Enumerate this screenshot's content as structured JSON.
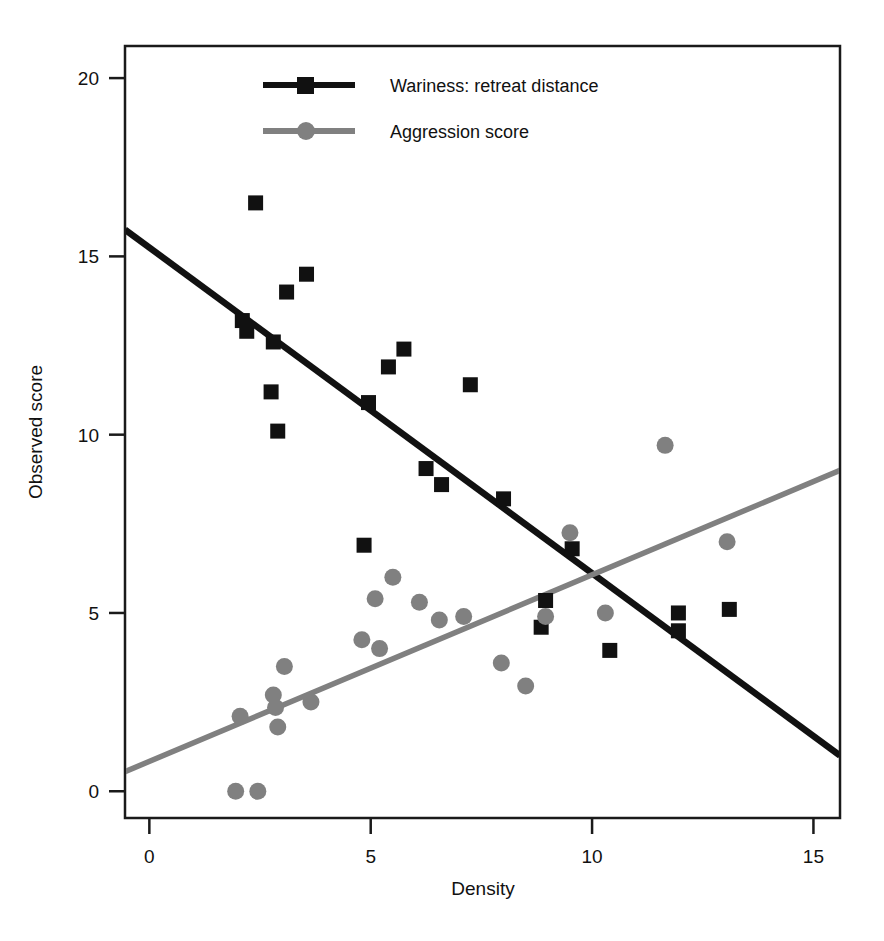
{
  "chart_data": {
    "type": "scatter",
    "title": "",
    "xlabel": "Density",
    "ylabel": "Observed  score",
    "xlim": [
      -0.55,
      15.6
    ],
    "ylim": [
      -0.75,
      20.9
    ],
    "xticks": [
      0,
      5,
      10,
      15
    ],
    "yticks": [
      0,
      5,
      10,
      15,
      20
    ],
    "xtick_labels": [
      "0",
      "5",
      "10",
      "15"
    ],
    "ytick_labels": [
      "0",
      "5",
      "10",
      "15",
      "20"
    ],
    "grid": false,
    "frame": true,
    "legend_position": "top-center",
    "series": [
      {
        "name": "Wariness: retreat distance",
        "marker": "square",
        "color": "#111111",
        "points": [
          [
            2.1,
            13.2
          ],
          [
            2.2,
            12.9
          ],
          [
            2.4,
            16.5
          ],
          [
            2.75,
            11.2
          ],
          [
            2.8,
            12.6
          ],
          [
            2.9,
            10.1
          ],
          [
            3.1,
            14.0
          ],
          [
            3.55,
            14.5
          ],
          [
            4.85,
            6.9
          ],
          [
            4.95,
            10.9
          ],
          [
            5.4,
            11.9
          ],
          [
            5.75,
            12.4
          ],
          [
            6.25,
            9.05
          ],
          [
            6.6,
            8.6
          ],
          [
            7.25,
            11.4
          ],
          [
            8.0,
            8.2
          ],
          [
            8.85,
            4.6
          ],
          [
            8.95,
            5.35
          ],
          [
            9.55,
            6.8
          ],
          [
            10.4,
            3.95
          ],
          [
            11.95,
            4.5
          ],
          [
            11.95,
            5.0
          ],
          [
            13.1,
            5.1
          ]
        ],
        "fit_line": {
          "x": [
            -0.55,
            15.6
          ],
          "y": [
            15.75,
            1.0
          ]
        }
      },
      {
        "name": "Aggression score",
        "marker": "circle",
        "color": "#808080",
        "points": [
          [
            1.95,
            0.0
          ],
          [
            2.45,
            0.0
          ],
          [
            2.05,
            2.1
          ],
          [
            2.8,
            2.7
          ],
          [
            2.85,
            2.35
          ],
          [
            2.9,
            1.8
          ],
          [
            3.05,
            3.5
          ],
          [
            3.65,
            2.5
          ],
          [
            4.8,
            4.25
          ],
          [
            5.1,
            5.4
          ],
          [
            5.2,
            4.0
          ],
          [
            5.5,
            6.0
          ],
          [
            6.1,
            5.3
          ],
          [
            6.55,
            4.8
          ],
          [
            7.1,
            4.9
          ],
          [
            7.95,
            3.6
          ],
          [
            8.5,
            2.95
          ],
          [
            8.95,
            4.9
          ],
          [
            9.5,
            7.25
          ],
          [
            10.3,
            5.0
          ],
          [
            11.65,
            9.7
          ],
          [
            13.05,
            7.0
          ]
        ],
        "fit_line": {
          "x": [
            -0.55,
            15.6
          ],
          "y": [
            0.55,
            9.0
          ]
        }
      }
    ]
  },
  "legend": {
    "entries": [
      {
        "label": "Wariness: retreat distance",
        "marker": "square",
        "color": "#111111"
      },
      {
        "label": "Aggression score",
        "marker": "circle",
        "color": "#808080"
      }
    ]
  },
  "axes": {
    "x_title": "Density",
    "y_title": "Observed  score",
    "x_ticks": [
      "0",
      "5",
      "10",
      "15"
    ],
    "y_ticks": [
      "20",
      "15",
      "10",
      "5",
      "0"
    ]
  }
}
